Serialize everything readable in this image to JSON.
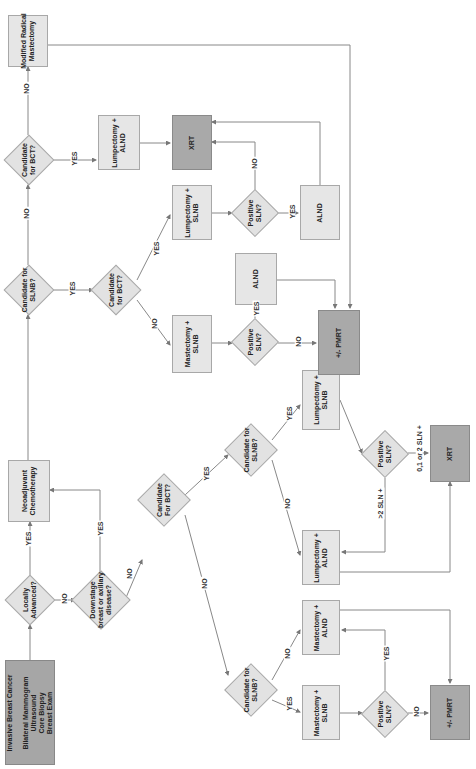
{
  "nodes": {
    "start": "Invasive Breast Cancer\n\nBilateral Mammogram\nUltrasound\nCore Biopsy\nBreast Exam",
    "locally_advanced": "Locally\nAdvanced?",
    "neoadjuvant": "Neoadjuvant\nChemotherapy",
    "downstage": "Downstage\nbreast or axillary\ndisease?",
    "cand_bct_low": "Candidate\nFor BCT?",
    "cand_slnb_low_yes": "Candidate for\nSLNB?",
    "cand_slnb_low_no": "Candidate for\nSLNB?",
    "lump_slnb_low": "Lumpectomy +\nSLNB",
    "lump_alnd_low": "Lumpectomy +\nALND",
    "pos_sln_low_right": "Positive\nSLN?",
    "xrt_low": "XRT",
    "mast_alnd_low": "Mastectomy +\nALND",
    "mast_slnb_low": "Mastectomy +\nSLNB",
    "pos_sln_low_left": "Positive\nSLN?",
    "pmrt_low": "+/- PMRT",
    "cand_slnb_up": "Candidate for\nSLNB?",
    "cand_bct_up": "Candidate\nfor BCT?",
    "modified_radical": "Modified Radical\nMastectomy",
    "cand_bct_inner": "Candidate\nfor BCT?",
    "lump_alnd_up": "Lumpectomy +\nALND",
    "xrt_up": "XRT",
    "lump_slnb_up": "Lumpectomy +\nSLNB",
    "mast_slnb_up": "Mastectomy +\nSLNB",
    "pos_sln_up_right": "Positive\nSLN?",
    "pos_sln_up_left": "Positive\nSLN?",
    "alnd_mid": "ALND",
    "alnd_right": "ALND",
    "pmrt_up": "+/- PMRT"
  },
  "edges": {
    "yes": "YES",
    "no": "NO",
    "gt2": ">2 SLN +",
    "zero12": "0,1 or 2 SLN +"
  }
}
